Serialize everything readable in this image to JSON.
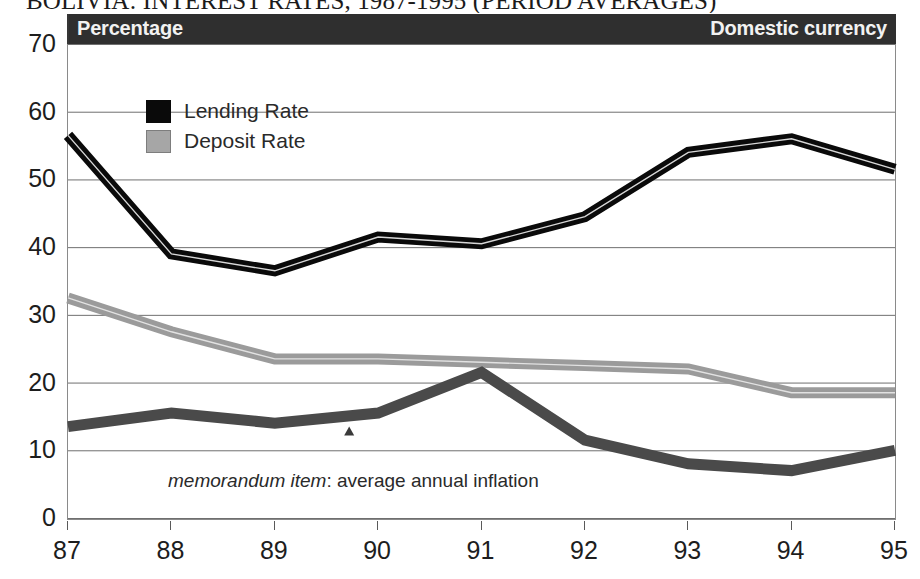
{
  "title": "BOLIVIA: INTEREST RATES, 1987-1995 (PERIOD AVERAGES)",
  "header": {
    "left_label": "Percentage",
    "right_label": "Domestic currency",
    "background": "#2f2f2f",
    "text_color": "#f2f2f2"
  },
  "legend": {
    "position": "top-left-inside",
    "items": [
      {
        "label": "Lending Rate",
        "swatch": "black",
        "color": "#0a0a0a"
      },
      {
        "label": "Deposit Rate",
        "swatch": "gray",
        "color": "#a6a6a6"
      }
    ]
  },
  "annotations": {
    "memo_italic": "memorandum item",
    "memo_rest": ": average annual inflation",
    "marker_icon": "triangle-marker"
  },
  "axes": {
    "y_ticks": [
      "70",
      "60",
      "50",
      "40",
      "30",
      "20",
      "10",
      "0"
    ],
    "x_ticks": [
      "87",
      "88",
      "89",
      "90",
      "91",
      "92",
      "93",
      "94",
      "95"
    ]
  },
  "chart_data": {
    "type": "line",
    "title": "BOLIVIA: INTEREST RATES, 1987-1995 (PERIOD AVERAGES)",
    "subtitle": "Percentage / Domestic currency",
    "xlabel": "",
    "ylabel": "Percentage",
    "x": [
      1987,
      1988,
      1989,
      1990,
      1991,
      1992,
      1993,
      1994,
      1995
    ],
    "categories": [
      "87",
      "88",
      "89",
      "90",
      "91",
      "92",
      "93",
      "94",
      "95"
    ],
    "ylim": [
      0,
      70
    ],
    "xlim": [
      1987,
      1995
    ],
    "grid": true,
    "y_tick_step": 10,
    "legend": [
      "Lending Rate",
      "Deposit Rate"
    ],
    "series": [
      {
        "name": "Lending Rate",
        "color": "#0a0a0a",
        "style": "thick-band",
        "values": [
          56.5,
          39.0,
          36.5,
          41.5,
          40.5,
          44.5,
          54.0,
          56.0,
          51.5
        ]
      },
      {
        "name": "Deposit Rate",
        "color": "#9b9b9b",
        "style": "thick-band",
        "values": [
          32.5,
          27.5,
          23.5,
          23.5,
          23.0,
          22.5,
          22.0,
          18.5,
          18.5
        ]
      },
      {
        "name": "average annual inflation",
        "color": "#4a4a4a",
        "style": "thick-band",
        "note": "memorandum item",
        "values": [
          13.5,
          15.5,
          14.0,
          15.5,
          21.5,
          11.5,
          8.0,
          7.0,
          10.0
        ]
      }
    ]
  }
}
